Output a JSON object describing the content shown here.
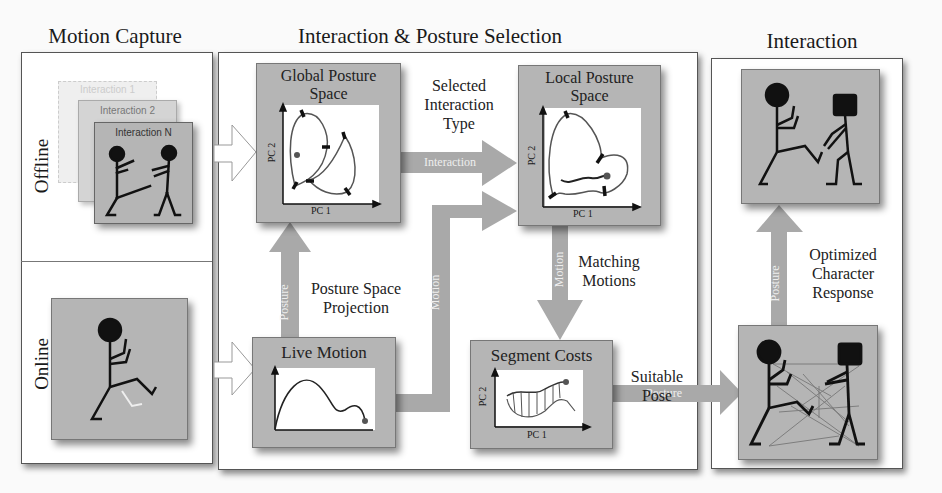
{
  "sections": {
    "motion_capture": {
      "title": "Motion Capture",
      "offline_label": "Offline",
      "online_label": "Online",
      "stack_cards": [
        "Interaction 1",
        "Interaction 2",
        "Interaction N"
      ]
    },
    "selection": {
      "title": "Interaction & Posture Selection",
      "global_box": {
        "title_line1": "Global Posture",
        "title_line2": "Space",
        "x_axis": "PC 1",
        "y_axis": "PC 2"
      },
      "local_box": {
        "title_line1": "Local Posture",
        "title_line2": "Space",
        "x_axis": "PC 1",
        "y_axis": "PC 2"
      },
      "live_box": {
        "title": "Live Motion"
      },
      "segment_box": {
        "title": "Segment Costs",
        "x_axis": "PC 1",
        "y_axis": "PC 2"
      },
      "captions": {
        "selected_line1": "Selected",
        "selected_line2": "Interaction",
        "selected_line3": "Type",
        "projection_line1": "Posture Space",
        "projection_line2": "Projection",
        "matching_line1": "Matching",
        "matching_line2": "Motions",
        "suitable_line1": "Suitable",
        "suitable_line2": "Pose"
      },
      "arrow_labels": {
        "interaction": "Interaction",
        "posture_up": "Posture",
        "motion_up": "Motion",
        "motion_down": "Motion",
        "posture_right": "Posture"
      }
    },
    "interaction": {
      "title": "Interaction",
      "caption_line1": "Optimized",
      "caption_line2": "Character",
      "caption_line3": "Response",
      "arrow_label": "Posture"
    }
  },
  "colors": {
    "box_fill": "#b5b5b5",
    "arrow_fill": "#a9a9a9",
    "panel_border": "#555555",
    "figure": "#111111"
  }
}
